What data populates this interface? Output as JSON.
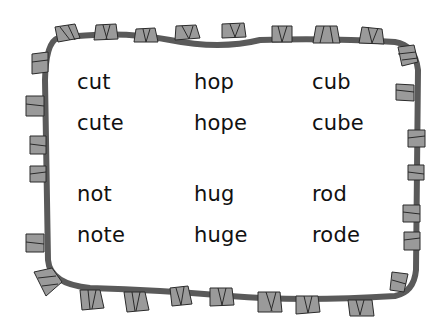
{
  "worksheet": {
    "title": "",
    "columns": [
      {
        "words": [
          "cut",
          "cute",
          "not",
          "note"
        ]
      },
      {
        "words": [
          "hop",
          "hope",
          "hug",
          "huge"
        ]
      },
      {
        "words": [
          "cub",
          "cube",
          "rod",
          "rode"
        ]
      }
    ]
  },
  "colors": {
    "border_fill": "#8c8c8c",
    "border_piece": "#9a9a9a",
    "border_stroke": "#2a2a2a",
    "background": "#ffffff",
    "text": "#111111"
  }
}
